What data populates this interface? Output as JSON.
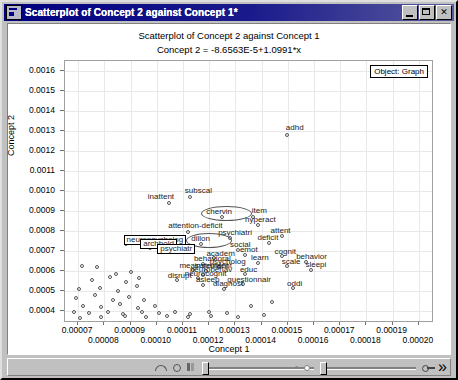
{
  "window": {
    "title": "Scatterplot of Concept 2 against Concept 1*",
    "icon": "chart-window-icon",
    "minimize_label": "",
    "maximize_label": "",
    "close_label": "✕"
  },
  "chart_data": {
    "type": "scatter",
    "title": "Scatterplot of Concept 2 against Concept 1",
    "subtitle": "Concept 2 = -8.6563E-5+1.0991*x",
    "xlabel": "Concept 1",
    "ylabel": "Concept 2",
    "grid": true,
    "legend": "Object: Graph",
    "legend_position": "top-right",
    "xlim": [
      6.5e-05,
      0.000205
    ],
    "ylim": [
      0.00035,
      0.00165
    ],
    "xticks": [
      "0.00007",
      "0.00008",
      "0.00009",
      "0.00010",
      "0.00011",
      "0.00012",
      "0.00013",
      "0.00014",
      "0.00015",
      "0.00016",
      "0.00017",
      "0.00018",
      "0.00019",
      "0.00020"
    ],
    "yticks": [
      "0.0016",
      "0.0015",
      "0.0014",
      "0.0013",
      "0.0012",
      "0.0011",
      "0.0010",
      "0.0009",
      "0.0008",
      "0.0007",
      "0.0006",
      "0.0005",
      "0.0004"
    ],
    "points": [
      {
        "label": "adhd",
        "x": 0.00015,
        "y": 0.00128,
        "label_dx": -2,
        "label_dy": -11,
        "style": "plain"
      },
      {
        "label": "subscal",
        "x": 0.000113,
        "y": 0.00097,
        "label_dx": -6,
        "label_dy": -10,
        "style": "plain"
      },
      {
        "label": "inattent",
        "x": 0.000105,
        "y": 0.00094,
        "label_dx": -22,
        "label_dy": -10,
        "style": "plain"
      },
      {
        "label": "chervin",
        "x": 0.000125,
        "y": 0.00087,
        "label_dx": -16,
        "label_dy": -9,
        "style": "ellipse"
      },
      {
        "label": "item",
        "x": 0.000137,
        "y": 0.00087,
        "label_dx": -2,
        "label_dy": -10,
        "style": "plain"
      },
      {
        "label": "hyperact",
        "x": 0.000139,
        "y": 0.00083,
        "label_dx": -14,
        "label_dy": -9,
        "style": "plain"
      },
      {
        "label": "attention-deficit",
        "x": 0.000112,
        "y": 0.000795,
        "label_dx": -20,
        "label_dy": -10,
        "style": "plain"
      },
      {
        "label": "attent",
        "x": 0.000148,
        "y": 0.000775,
        "label_dx": -12,
        "label_dy": -9,
        "style": "plain"
      },
      {
        "label": "psychiatri",
        "x": 0.000128,
        "y": 0.000765,
        "label_dx": -12,
        "label_dy": -9,
        "style": "plain"
      },
      {
        "label": "deficit",
        "x": 0.000143,
        "y": 0.00074,
        "label_dx": -12,
        "label_dy": -9,
        "style": "plain"
      },
      {
        "label": "neuropsycholog",
        "x": 8.85e-05,
        "y": 0.000735,
        "label_dx": -3,
        "label_dy": -9,
        "style": "boxed"
      },
      {
        "label": "dillon",
        "x": 0.000117,
        "y": 0.000735,
        "label_dx": -10,
        "label_dy": -9,
        "style": "ellipse"
      },
      {
        "label": "archbold",
        "x": 9.75e-05,
        "y": 0.000715,
        "label_dx": -10,
        "label_dy": -9,
        "style": "boxed"
      },
      {
        "label": "social",
        "x": 0.000131,
        "y": 0.000705,
        "label_dx": -8,
        "label_dy": -9,
        "style": "plain"
      },
      {
        "label": "psychiatr",
        "x": 0.000104,
        "y": 0.000692,
        "label_dx": -10,
        "label_dy": -9,
        "style": "boxed"
      },
      {
        "label": "cognit",
        "x": 0.000148,
        "y": 0.000672,
        "label_dx": -8,
        "label_dy": -9,
        "style": "plain"
      },
      {
        "label": "emot",
        "x": 0.000134,
        "y": 0.000678,
        "label_dx": -6,
        "label_dy": -9,
        "style": "plain"
      },
      {
        "label": "academ",
        "x": 0.000122,
        "y": 0.000662,
        "label_dx": -8,
        "label_dy": -9,
        "style": "plain"
      },
      {
        "label": "behavior",
        "x": 0.000157,
        "y": 0.000645,
        "label_dx": -10,
        "label_dy": -9,
        "style": "plain"
      },
      {
        "label": "learn",
        "x": 0.000139,
        "y": 0.000638,
        "label_dx": -8,
        "label_dy": -9,
        "style": "plain"
      },
      {
        "label": "scale",
        "x": 0.00015,
        "y": 0.000622,
        "label_dx": -6,
        "label_dy": -9,
        "style": "plain"
      },
      {
        "label": "sleepi",
        "x": 0.000159,
        "y": 0.000605,
        "label_dx": -6,
        "label_dy": -9,
        "style": "plain"
      },
      {
        "label": "behavioral",
        "x": 0.000118,
        "y": 0.000635,
        "label_dx": -10,
        "label_dy": -9,
        "style": "plain"
      },
      {
        "label": "psycholog",
        "x": 0.000124,
        "y": 0.000618,
        "label_dx": -10,
        "label_dy": -9,
        "style": "plain"
      },
      {
        "label": "measurement",
        "x": 0.000114,
        "y": 0.000602,
        "label_dx": -14,
        "label_dy": -9,
        "style": "plain"
      },
      {
        "label": "instrument",
        "x": 0.000119,
        "y": 0.000598,
        "label_dx": -12,
        "label_dy": -9,
        "style": "plain"
      },
      {
        "label": "educ",
        "x": 0.000134,
        "y": 0.000582,
        "label_dx": -6,
        "label_dy": -9,
        "style": "plain"
      },
      {
        "label": "neurobehav",
        "x": 0.000118,
        "y": 0.000578,
        "label_dx": -14,
        "label_dy": -9,
        "style": "plain"
      },
      {
        "label": "neurocognit",
        "x": 0.000116,
        "y": 0.000562,
        "label_dx": -14,
        "label_dy": -9,
        "style": "plain"
      },
      {
        "label": "disrupt",
        "x": 0.000108,
        "y": 0.000552,
        "label_dx": -10,
        "label_dy": -9,
        "style": "plain"
      },
      {
        "label": "asleep",
        "x": 0.000118,
        "y": 0.000528,
        "label_dx": -8,
        "label_dy": -9,
        "style": "plain"
      },
      {
        "label": "questionnair",
        "x": 0.000133,
        "y": 0.000532,
        "label_dx": -16,
        "label_dy": -9,
        "style": "plain"
      },
      {
        "label": "oddi",
        "x": 0.000152,
        "y": 0.000512,
        "label_dx": -6,
        "label_dy": -9,
        "style": "plain"
      },
      {
        "label": "diagnost",
        "x": 0.000126,
        "y": 0.000508,
        "label_dx": -12,
        "label_dy": -9,
        "style": "plain"
      }
    ],
    "unlabeled_points": [
      {
        "x": 7.15e-05,
        "y": 0.000625
      },
      {
        "x": 7.75e-05,
        "y": 0.000618
      },
      {
        "x": 8.45e-05,
        "y": 0.000585
      },
      {
        "x": 9.05e-05,
        "y": 0.000595
      },
      {
        "x": 7.55e-05,
        "y": 0.000552
      },
      {
        "x": 8.25e-05,
        "y": 0.00057
      },
      {
        "x": 8.85e-05,
        "y": 0.000545
      },
      {
        "x": 9.35e-05,
        "y": 0.000562
      },
      {
        "x": 7.05e-05,
        "y": 0.000508
      },
      {
        "x": 7.85e-05,
        "y": 0.000515
      },
      {
        "x": 8.55e-05,
        "y": 0.000498
      },
      {
        "x": 9.25e-05,
        "y": 0.000525
      },
      {
        "x": 6.95e-05,
        "y": 0.000462
      },
      {
        "x": 7.65e-05,
        "y": 0.000478
      },
      {
        "x": 8.35e-05,
        "y": 0.000455
      },
      {
        "x": 8.95e-05,
        "y": 0.00047
      },
      {
        "x": 9.55e-05,
        "y": 0.000452
      },
      {
        "x": 7.2e-05,
        "y": 0.000425
      },
      {
        "x": 7.9e-05,
        "y": 0.000418
      },
      {
        "x": 8.6e-05,
        "y": 0.000432
      },
      {
        "x": 9.3e-05,
        "y": 0.000412
      },
      {
        "x": 9.95e-05,
        "y": 0.000425
      },
      {
        "x": 6.85e-05,
        "y": 0.000392
      },
      {
        "x": 7.45e-05,
        "y": 0.000388
      },
      {
        "x": 8.15e-05,
        "y": 0.000395
      },
      {
        "x": 8.75e-05,
        "y": 0.000385
      },
      {
        "x": 9.45e-05,
        "y": 0.000392
      },
      {
        "x": 0.000101,
        "y": 0.000388
      },
      {
        "x": 0.000107,
        "y": 0.000395
      },
      {
        "x": 0.000113,
        "y": 0.000385
      },
      {
        "x": 0.00012,
        "y": 0.000392
      },
      {
        "x": 0.000127,
        "y": 0.000388
      },
      {
        "x": 8.8e-05,
        "y": 0.000372
      },
      {
        "x": 9.6e-05,
        "y": 0.000368
      },
      {
        "x": 0.000104,
        "y": 0.000372
      },
      {
        "x": 0.000112,
        "y": 0.000368
      },
      {
        "x": 0.000121,
        "y": 0.000372
      },
      {
        "x": 0.000131,
        "y": 0.000368
      },
      {
        "x": 0.000141,
        "y": 0.000378
      },
      {
        "x": 7.9e-05,
        "y": 0.000368
      },
      {
        "x": 7.1e-05,
        "y": 0.000365
      },
      {
        "x": 0.000136,
        "y": 0.000422
      },
      {
        "x": 0.000144,
        "y": 0.000445
      }
    ]
  },
  "statusbar": {
    "icons": [
      "curve-icon",
      "circle-icon",
      "bars-icon"
    ],
    "slider_left": "zoom-slider",
    "slider_right": "pan-slider",
    "key_icon": "key-icon",
    "updown": "»"
  }
}
